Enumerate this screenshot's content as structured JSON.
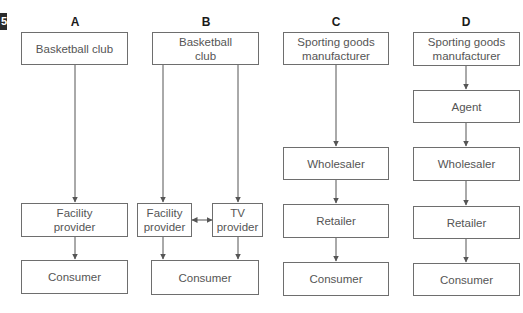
{
  "figure_number": "5",
  "diagrams": [
    {
      "label": "A",
      "nodes": [
        "Basketball club",
        "Facility provider",
        "Consumer"
      ]
    },
    {
      "label": "B",
      "nodes": [
        "Basketball club",
        "Facility provider",
        "TV provider",
        "Consumer"
      ]
    },
    {
      "label": "C",
      "nodes": [
        "Sporting goods manufacturer",
        "Wholesaler",
        "Retailer",
        "Consumer"
      ]
    },
    {
      "label": "D",
      "nodes": [
        "Sporting goods manufacturer",
        "Agent",
        "Wholesaler",
        "Retailer",
        "Consumer"
      ]
    }
  ],
  "edges": [
    {
      "diagram": "A",
      "from": "Basketball club",
      "to": "Facility provider",
      "type": "directed"
    },
    {
      "diagram": "A",
      "from": "Facility provider",
      "to": "Consumer",
      "type": "directed"
    },
    {
      "diagram": "B",
      "from": "Basketball club",
      "to": "Facility provider",
      "type": "directed"
    },
    {
      "diagram": "B",
      "from": "Basketball club",
      "to": "TV provider",
      "type": "directed"
    },
    {
      "diagram": "B",
      "from": "Facility provider",
      "to": "TV provider",
      "type": "bidirectional"
    },
    {
      "diagram": "B",
      "from": "Facility provider",
      "to": "Consumer",
      "type": "directed"
    },
    {
      "diagram": "B",
      "from": "TV provider",
      "to": "Consumer",
      "type": "directed"
    },
    {
      "diagram": "C",
      "from": "Sporting goods manufacturer",
      "to": "Wholesaler",
      "type": "directed"
    },
    {
      "diagram": "C",
      "from": "Wholesaler",
      "to": "Retailer",
      "type": "directed"
    },
    {
      "diagram": "C",
      "from": "Retailer",
      "to": "Consumer",
      "type": "directed"
    },
    {
      "diagram": "D",
      "from": "Sporting goods manufacturer",
      "to": "Agent",
      "type": "directed"
    },
    {
      "diagram": "D",
      "from": "Agent",
      "to": "Wholesaler",
      "type": "directed"
    },
    {
      "diagram": "D",
      "from": "Wholesaler",
      "to": "Retailer",
      "type": "directed"
    },
    {
      "diagram": "D",
      "from": "Retailer",
      "to": "Consumer",
      "type": "directed"
    }
  ],
  "colors": {
    "line": "#555555",
    "box_border": "#6e6e6e",
    "text": "#555555",
    "label": "#1a1a1a"
  }
}
